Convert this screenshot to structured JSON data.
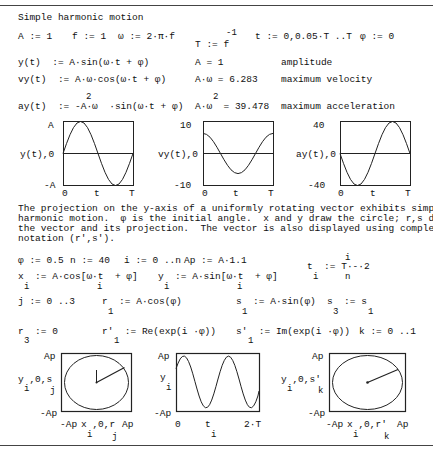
{
  "title": "Simple harmonic motion",
  "defs_row1": {
    "A": "A := 1",
    "f": "f := 1",
    "omega": "ω := 2·π·f",
    "T_exp": "-1",
    "T": "T := f",
    "t": "t := 0,0.05·T ..T",
    "phi": "φ := 0"
  },
  "equations": [
    {
      "def": "y(t)  := A·sin(ω·t + φ)",
      "result": "A = 1",
      "desc": "amplitude"
    },
    {
      "def": "vy(t)  := A·ω·cos(ω·t + φ)",
      "result": "A·ω = 6.283",
      "desc": "maximum velocity"
    },
    {
      "def": "ay(t)  := -A·ω  ·sin(ω·t + φ)",
      "def_sup": "2",
      "result": "A·ω  = 39.478",
      "result_sup": "2",
      "desc": "maximum acceleration"
    }
  ],
  "plots_top": [
    {
      "ylabel": "y(t),0",
      "ymax": "A",
      "ymin": "-A",
      "xmin": "0",
      "xlabel": "t",
      "xmax": "T"
    },
    {
      "ylabel": "vy(t),0",
      "ymax": "10",
      "ymin": "-10",
      "xmin": "0",
      "xlabel": "t",
      "xmax": "T"
    },
    {
      "ylabel": "ay(t),0",
      "ymax": "40",
      "ymin": "-40",
      "xmin": "0",
      "xlabel": "t",
      "xmax": "T"
    }
  ],
  "paragraph": "The projection on the y-axis of a uniformly rotating vector exhibits simple\nharmonic motion.  φ is the initial angle.  x and y draw the circle; r,s draws\nthe vector and its projection.  The vector is also displayed using complex\nnotation (r',s').",
  "defs_row2": {
    "phi": "φ := 0.5",
    "n": "n := 40",
    "i": "i := 0 ..n",
    "Ap": "Ap := A·1.1",
    "t_i_num": "i",
    "t_i": "t  := T·-·2",
    "t_i_sub": "i",
    "t_i_den": "n"
  },
  "defs_row3": {
    "x": "x  := A·cos[ω·t  + φ]",
    "x_sub": "i",
    "x_t_sub": "i",
    "y": "y  := A·sin[ω·t  + φ]",
    "y_sub": "i",
    "y_t_sub": "i"
  },
  "defs_row4": {
    "j": "j := 0 ..3",
    "r1": "r  := A·cos(φ)",
    "r1_sub": "1",
    "s1": "s  := A·sin(φ)",
    "s1_sub": "1",
    "s3": "s  := s",
    "s3_sub": "3",
    "s3_rhs_sub": "1"
  },
  "defs_row5": {
    "r3": "r  := 0",
    "r3_sub": "3",
    "rp1": "r'  := Re(exp(i ·φ))",
    "rp1_sub": "1",
    "sp1": "s'  := Im(exp(i ·φ))",
    "sp1_sub": "1",
    "k": "k := 0 ..1"
  },
  "plots_bottom": [
    {
      "ylabel": "y ,0,s",
      "ylabel_sub1": "i",
      "ylabel_sub2": "j",
      "ymax": "Ap",
      "ymin": "-Ap",
      "xmin": "-Ap",
      "xlabel": "x ,0,r",
      "xlabel_sub1": "i",
      "xlabel_sub2": "j",
      "xmax": "Ap"
    },
    {
      "ylabel": "y",
      "ylabel_sub1": "i",
      "ymax": "Ap",
      "ymin": "-Ap",
      "xmin": "0",
      "xlabel": "t",
      "xlabel_sub1": "i",
      "xmax": "2·T"
    },
    {
      "ylabel": "y ,0,s'",
      "ylabel_sub1": "i",
      "ylabel_sub2": "k",
      "ymax": "Ap",
      "ymin": "-Ap",
      "xmin": "-Ap",
      "xlabel": "x ,0,r'",
      "xlabel_sub1": "i",
      "xlabel_sub2": "k",
      "xmax": "Ap"
    }
  ]
}
